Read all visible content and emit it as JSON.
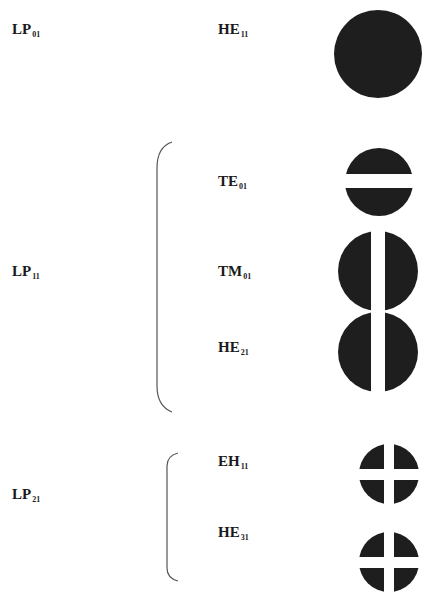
{
  "colors": {
    "mode_fill": "#1e1e1e",
    "bracket": "#555555",
    "background": "#ffffff"
  },
  "groups": [
    {
      "lp_mode": {
        "base": "LP",
        "sub": "01"
      },
      "vector_modes": [
        {
          "base": "HE",
          "sub": "11",
          "pattern": "full-circle"
        }
      ]
    },
    {
      "lp_mode": {
        "base": "LP",
        "sub": "11"
      },
      "vector_modes": [
        {
          "base": "TE",
          "sub": "01",
          "pattern": "horizontal-split-halves"
        },
        {
          "base": "TM",
          "sub": "01",
          "pattern": "vertical-split-halves"
        },
        {
          "base": "HE",
          "sub": "21",
          "pattern": "vertical-split-halves"
        }
      ]
    },
    {
      "lp_mode": {
        "base": "LP",
        "sub": "21"
      },
      "vector_modes": [
        {
          "base": "EH",
          "sub": "11",
          "pattern": "four-quadrants"
        },
        {
          "base": "HE",
          "sub": "31",
          "pattern": "four-quadrants"
        }
      ]
    }
  ]
}
